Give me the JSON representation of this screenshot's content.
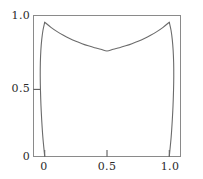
{
  "chart_data": {
    "type": "line",
    "title": "",
    "xlabel": "",
    "ylabel": "",
    "xlim": [
      -0.09,
      1.09
    ],
    "ylim": [
      0,
      1.05
    ],
    "grid": false,
    "legend": null,
    "xticks": [
      {
        "value": 0,
        "label": "0"
      },
      {
        "value": 0.5,
        "label": "0.5"
      },
      {
        "value": 1.0,
        "label": "1.0"
      }
    ],
    "yticks": [
      {
        "value": 0,
        "label": "0"
      },
      {
        "value": 0.5,
        "label": "0.5"
      },
      {
        "value": 1.0,
        "label": "1.0"
      }
    ],
    "line_color": "#6b6b6b",
    "frame_color": "#8a8a8a",
    "series": [
      {
        "name": "upper-catenary-curve",
        "comment": "arc from (0,1) dipping to minimum ~0.78 at x=0.5 and back to (1,1)",
        "x": [
          0.0,
          0.05,
          0.1,
          0.15,
          0.2,
          0.25,
          0.3,
          0.35,
          0.4,
          0.45,
          0.5,
          0.55,
          0.6,
          0.65,
          0.7,
          0.75,
          0.8,
          0.85,
          0.9,
          0.95,
          1.0
        ],
        "y": [
          1.0,
          0.962,
          0.93,
          0.903,
          0.879,
          0.858,
          0.84,
          0.824,
          0.81,
          0.799,
          0.786,
          0.799,
          0.81,
          0.824,
          0.84,
          0.858,
          0.879,
          0.903,
          0.93,
          0.962,
          1.0
        ]
      },
      {
        "name": "left-descending-curve",
        "comment": "steep branch from (0,1) bowing left to about x=-0.035 then down to (0,0)",
        "x": [
          0.0,
          -0.014,
          -0.024,
          -0.031,
          -0.035,
          -0.036,
          -0.034,
          -0.03,
          -0.024,
          -0.015,
          0.0
        ],
        "y": [
          1.0,
          0.94,
          0.87,
          0.79,
          0.7,
          0.6,
          0.49,
          0.38,
          0.27,
          0.145,
          0.0
        ]
      },
      {
        "name": "right-descending-curve",
        "comment": "steep branch from (1,1) bowing right to about x=1.035 then down to (1,0)",
        "x": [
          1.0,
          1.014,
          1.024,
          1.031,
          1.035,
          1.036,
          1.034,
          1.03,
          1.024,
          1.015,
          1.0
        ],
        "y": [
          1.0,
          0.94,
          0.87,
          0.79,
          0.7,
          0.6,
          0.49,
          0.38,
          0.27,
          0.145,
          0.0
        ]
      }
    ]
  },
  "axes": {
    "y_labels": {
      "top": "1.0",
      "middle": "0.5",
      "bottom": "0"
    },
    "x_labels": {
      "left": "0",
      "middle": "0.5",
      "right": "1.0"
    }
  }
}
